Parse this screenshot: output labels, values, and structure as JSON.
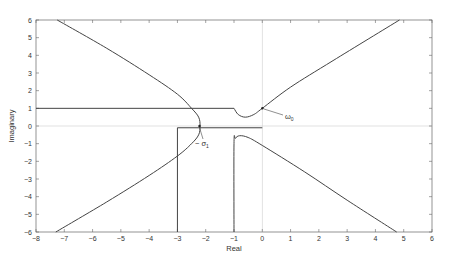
{
  "chart_data": {
    "type": "line",
    "title": "",
    "xlabel": "Real",
    "ylabel": "Imaginary",
    "xlim": [
      -8,
      6
    ],
    "ylim": [
      -6,
      6
    ],
    "xticks": [
      "-8",
      "-7",
      "-6",
      "-5",
      "-4",
      "-3",
      "-2",
      "-1",
      "0",
      "1",
      "2",
      "3",
      "4",
      "5",
      "6"
    ],
    "yticks": [
      "6",
      "5",
      "4",
      "3",
      "2",
      "1",
      "0",
      "-1",
      "-2",
      "-3",
      "-4",
      "-5",
      "-6"
    ],
    "grid": false,
    "zero_lines": true,
    "annotations": [
      {
        "text": "ω0",
        "point": [
          0.0,
          1.0
        ],
        "label_pos": [
          0.8,
          0.6
        ]
      },
      {
        "text": "−σ1",
        "point": [
          -2.2,
          0.0
        ],
        "label_pos": [
          -2.0,
          -0.9
        ]
      }
    ],
    "series": [
      {
        "name": "left-branch",
        "x": [
          -7.25,
          -5.5,
          -4.0,
          -3.0,
          -2.5,
          -2.25,
          -2.2,
          -2.25,
          -2.5,
          -3.0,
          -4.0,
          -5.5,
          -7.3
        ],
        "y": [
          6.0,
          4.4,
          2.9,
          1.8,
          1.0,
          0.5,
          0.0,
          -0.5,
          -1.0,
          -1.7,
          -2.8,
          -4.3,
          -6.0
        ]
      },
      {
        "name": "upper-right-branch",
        "x": [
          -1.0,
          -0.85,
          -0.6,
          -0.3,
          0.0,
          1.0,
          2.5,
          4.85
        ],
        "y": [
          1.0,
          0.65,
          0.5,
          0.65,
          1.0,
          2.2,
          3.7,
          6.0
        ]
      },
      {
        "name": "lower-right-branch",
        "x": [
          -1.0,
          -1.0,
          -0.95,
          -0.8,
          -0.5,
          0.0,
          1.5,
          3.0,
          4.75
        ],
        "y": [
          -6.0,
          -1.0,
          -0.7,
          -0.55,
          -0.65,
          -1.1,
          -2.6,
          -4.2,
          -6.0
        ]
      },
      {
        "name": "horizontal-imag-1",
        "x": [
          -8.0,
          -1.0
        ],
        "y": [
          1.0,
          1.0
        ]
      },
      {
        "name": "horizontal-near-zero",
        "x": [
          -3.0,
          0.0
        ],
        "y": [
          -0.1,
          -0.1
        ]
      },
      {
        "name": "vertical-real-minus-3",
        "x": [
          -3.0,
          -3.0
        ],
        "y": [
          -0.1,
          -6.0
        ]
      }
    ]
  }
}
